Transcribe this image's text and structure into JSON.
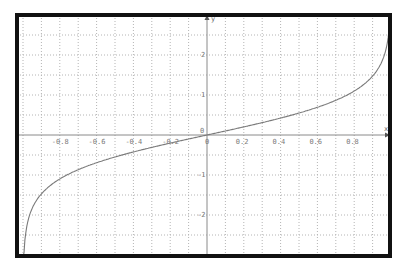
{
  "chart_data": {
    "type": "line",
    "title": "",
    "function": "y = artanh(x)",
    "xlabel": "x",
    "ylabel": "y",
    "xlim": [
      -1.0,
      1.0
    ],
    "ylim": [
      -3.0,
      3.0
    ],
    "grid": true,
    "legend": null,
    "x_ticks": [
      -0.8,
      -0.6,
      -0.4,
      -0.2,
      0,
      0.2,
      0.4,
      0.6,
      0.8
    ],
    "x_tick_labels": [
      "-0.8",
      "-0.6",
      "-0.4",
      "-0.2",
      "0",
      "0.2",
      "0.4",
      "0.6",
      "0.8"
    ],
    "y_ticks": [
      -2,
      -1,
      0,
      1,
      2
    ],
    "y_tick_labels": [
      "-2",
      "-1",
      "0",
      "1",
      "2"
    ],
    "origin_label": "0",
    "series": [
      {
        "name": "artanh(x)",
        "x": [
          -0.995,
          -0.99,
          -0.98,
          -0.96,
          -0.94,
          -0.9,
          -0.85,
          -0.8,
          -0.7,
          -0.6,
          -0.5,
          -0.4,
          -0.3,
          -0.2,
          -0.1,
          0,
          0.1,
          0.2,
          0.3,
          0.4,
          0.5,
          0.6,
          0.7,
          0.8,
          0.85,
          0.9,
          0.94,
          0.96,
          0.98,
          0.99,
          0.995
        ],
        "values": [
          -2.99,
          -2.65,
          -2.3,
          -1.95,
          -1.74,
          -1.47,
          -1.26,
          -1.1,
          -0.87,
          -0.69,
          -0.55,
          -0.42,
          -0.31,
          -0.2,
          -0.1,
          0,
          0.1,
          0.2,
          0.31,
          0.42,
          0.55,
          0.69,
          0.87,
          1.1,
          1.26,
          1.47,
          1.74,
          1.95,
          2.3,
          2.65,
          2.99
        ]
      }
    ]
  },
  "colors": {
    "frame": "#111111",
    "grid": "#b4b4b4",
    "axis": "#8a8a8a",
    "curve": "#7a7a7a",
    "labels": "#7a7a7a"
  }
}
